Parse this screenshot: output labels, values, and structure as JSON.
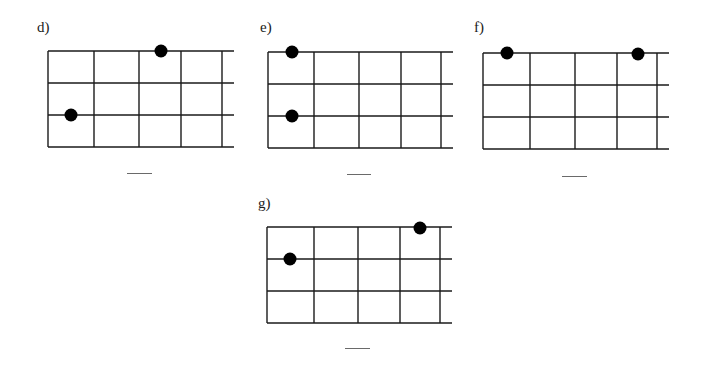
{
  "problems": [
    {
      "id": "d",
      "label": "d)",
      "label_pos": [
        37,
        20
      ],
      "grid": {
        "left": 48,
        "top": 51,
        "cols_x": [
          48,
          94,
          139,
          181,
          222
        ],
        "rows_y": [
          51,
          83,
          115,
          147
        ],
        "h_extend_to": 234
      },
      "dots": [
        [
          161,
          51
        ],
        [
          71,
          115
        ]
      ],
      "blank": {
        "x": 127,
        "y": 173,
        "w": 25
      }
    },
    {
      "id": "e",
      "label": "e)",
      "label_pos": [
        260,
        20
      ],
      "grid": {
        "left": 268,
        "top": 52,
        "cols_x": [
          268,
          314,
          359,
          401,
          441
        ],
        "rows_y": [
          52,
          84,
          116,
          148
        ],
        "h_extend_to": 453
      },
      "dots": [
        [
          292,
          52
        ],
        [
          292,
          116
        ]
      ],
      "blank": {
        "x": 347,
        "y": 174,
        "w": 24
      }
    },
    {
      "id": "f",
      "label": "f)",
      "label_pos": [
        474,
        20
      ],
      "grid": {
        "left": 483,
        "top": 53,
        "cols_x": [
          483,
          530,
          575,
          617,
          657
        ],
        "rows_y": [
          53,
          85,
          117,
          149
        ],
        "h_extend_to": 669
      },
      "dots": [
        [
          507,
          53
        ],
        [
          638,
          54
        ]
      ],
      "blank": {
        "x": 562,
        "y": 176,
        "w": 25
      }
    },
    {
      "id": "g",
      "label": "g)",
      "label_pos": [
        258,
        196
      ],
      "grid": {
        "left": 267,
        "top": 227,
        "cols_x": [
          267,
          314,
          358,
          400,
          440
        ],
        "rows_y": [
          227,
          259,
          291,
          323
        ],
        "h_extend_to": 452
      },
      "dots": [
        [
          290,
          259
        ],
        [
          420,
          228
        ]
      ],
      "blank": {
        "x": 345,
        "y": 348,
        "w": 25
      }
    }
  ],
  "style": {
    "line_color": "#1a1a1a",
    "dot_color": "#000000",
    "dot_radius": 6.5,
    "blank_color": "#6a6a6a"
  }
}
